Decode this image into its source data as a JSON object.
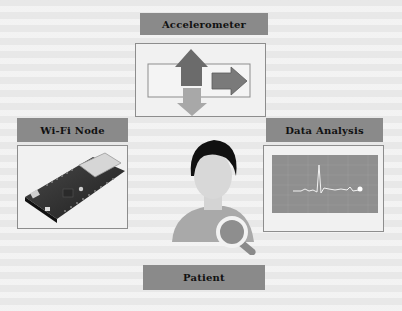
{
  "diagram": {
    "nodes": [
      {
        "id": "accelerometer",
        "label": "Accelerometer",
        "icon": "directional-arrows-icon"
      },
      {
        "id": "wifi_node",
        "label": "Wi-Fi Node",
        "icon": "microcontroller-board-image"
      },
      {
        "id": "data_analysis",
        "label": "Data Analysis",
        "icon": "ecg-waveform-chart"
      },
      {
        "id": "patient",
        "label": "Patient",
        "icon": "person-with-magnifier-icon"
      }
    ],
    "center": {
      "figure": "patient-avatar"
    }
  },
  "colors": {
    "label_bg": "#8a8a8a",
    "panel_border": "#8d8d8d",
    "arrow_up": "#6b6b6b",
    "arrow_right": "#7a7a7a",
    "arrow_down": "#a8a8a8",
    "chart_bg": "#8f8f8f",
    "hair": "#111111",
    "skin": "#d8d8d8",
    "body": "#a9a9a9"
  }
}
